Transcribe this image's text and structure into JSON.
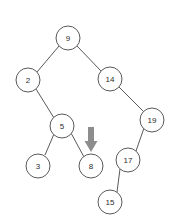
{
  "figure": {
    "background_color": "#ffffff",
    "node_fill": "#ffffff",
    "node_stroke": "#595959",
    "edge_color": "#595959",
    "label_color": "#2b2b2b",
    "arrow_color": "#8d8d8d"
  },
  "nodes": [
    {
      "id": "n9",
      "label": "9",
      "cx": 68,
      "cy": 38,
      "r": 12
    },
    {
      "id": "n2",
      "label": "2",
      "cx": 28,
      "cy": 80,
      "r": 12
    },
    {
      "id": "n14",
      "label": "14",
      "cx": 110,
      "cy": 79,
      "r": 12
    },
    {
      "id": "n5",
      "label": "5",
      "cx": 62,
      "cy": 126,
      "r": 12
    },
    {
      "id": "n19",
      "label": "19",
      "cx": 152,
      "cy": 120,
      "r": 12
    },
    {
      "id": "n3",
      "label": "3",
      "cx": 38,
      "cy": 166,
      "r": 12
    },
    {
      "id": "n8",
      "label": "8",
      "cx": 91,
      "cy": 166,
      "r": 12
    },
    {
      "id": "n17",
      "label": "17",
      "cx": 128,
      "cy": 160,
      "r": 12
    },
    {
      "id": "n15",
      "label": "15",
      "cx": 110,
      "cy": 202,
      "r": 12
    }
  ],
  "edges": [
    {
      "id": "e9-2",
      "from": "n9",
      "to": "n2",
      "x1": 59,
      "y1": 46,
      "x2": 37,
      "y2": 72
    },
    {
      "id": "e9-14",
      "from": "n9",
      "to": "n14",
      "x1": 77,
      "y1": 46,
      "x2": 101,
      "y2": 71
    },
    {
      "id": "e2-5",
      "from": "n2",
      "to": "n5",
      "x1": 36,
      "y1": 89,
      "x2": 54,
      "y2": 118
    },
    {
      "id": "e14-19",
      "from": "n14",
      "to": "n19",
      "x1": 119,
      "y1": 87,
      "x2": 144,
      "y2": 112
    },
    {
      "id": "e5-3",
      "from": "n5",
      "to": "n3",
      "x1": 54,
      "y1": 134,
      "x2": 45,
      "y2": 155
    },
    {
      "id": "e5-8",
      "from": "n5",
      "to": "n8",
      "x1": 71,
      "y1": 133,
      "x2": 84,
      "y2": 157
    },
    {
      "id": "e19-17",
      "from": "n19",
      "to": "n17",
      "x1": 144,
      "y1": 128,
      "x2": 136,
      "y2": 151
    },
    {
      "id": "e17-15",
      "from": "n17",
      "to": "n15",
      "x1": 120,
      "y1": 169,
      "x2": 117,
      "y2": 192
    }
  ],
  "pointer": {
    "id": "p8",
    "target_node": "n8",
    "label": "",
    "x": 91,
    "y_top": 127,
    "y_tip": 152,
    "shaft_width": 6,
    "head_width": 13
  },
  "chart_data": {
    "type": "tree",
    "root": "9",
    "values": [
      9,
      2,
      14,
      5,
      19,
      3,
      8,
      17,
      15
    ],
    "links": [
      {
        "parent": "9",
        "child": "2",
        "side": "left"
      },
      {
        "parent": "9",
        "child": "14",
        "side": "right"
      },
      {
        "parent": "2",
        "child": "5",
        "side": "right"
      },
      {
        "parent": "14",
        "child": "19",
        "side": "right"
      },
      {
        "parent": "5",
        "child": "3",
        "side": "left"
      },
      {
        "parent": "5",
        "child": "8",
        "side": "right"
      },
      {
        "parent": "19",
        "child": "17",
        "side": "left"
      },
      {
        "parent": "17",
        "child": "15",
        "side": "left"
      }
    ],
    "highlighted_node": "8",
    "annotation": "downward arrow pointing at node 8"
  }
}
